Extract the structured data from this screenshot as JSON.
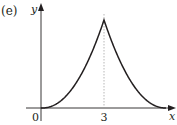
{
  "chart_data": {
    "type": "line",
    "panel_label": "(e)",
    "title": "",
    "xlabel": "x",
    "ylabel": "y",
    "origin_label": "0",
    "x_ticks": [
      {
        "value": 3,
        "label": "3"
      }
    ],
    "xlim": [
      -0.7,
      6.5
    ],
    "ylim": [
      -0.5,
      4.9
    ],
    "grid": false,
    "legend": null,
    "annotations": [
      {
        "type": "dashed-vertical-line",
        "x": 3,
        "description": "asymptote-like guide at x = 3"
      }
    ],
    "series": [
      {
        "name": "curve",
        "description": "Increasing convex branch from origin to a cusp at x=3, then decreasing convex branch toward the x-axis (symmetric about x=3)",
        "x": [
          0,
          0.5,
          1,
          1.5,
          2,
          2.5,
          2.8,
          3,
          3.2,
          3.5,
          4,
          4.5,
          5,
          5.5,
          5.9
        ],
        "y": [
          0,
          0.25,
          0.55,
          0.95,
          1.5,
          2.4,
          3.4,
          4.4,
          3.4,
          2.4,
          1.5,
          0.95,
          0.55,
          0.25,
          0
        ]
      }
    ],
    "colors": {
      "axis": "#231f20",
      "curve": "#231f20",
      "guide": "#9a9a9a"
    }
  }
}
